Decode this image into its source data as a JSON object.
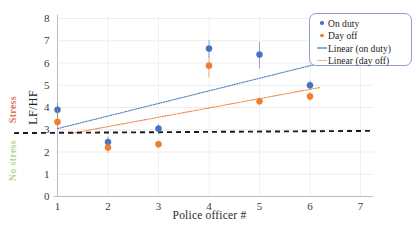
{
  "chart_data": {
    "type": "scatter",
    "title": "",
    "xlabel": "Police officer #",
    "ylabel": "LF/HF",
    "xlim": [
      0.5,
      7.3
    ],
    "ylim": [
      0,
      8
    ],
    "xticks": [
      1,
      2,
      3,
      4,
      5,
      6,
      7
    ],
    "yticks": [
      0,
      1,
      2,
      3,
      4,
      5,
      6,
      7,
      8
    ],
    "grid": true,
    "legend_position": "top-right",
    "x": [
      1,
      2,
      3,
      4,
      5,
      6
    ],
    "series": [
      {
        "name": "On duty",
        "color": "#4472c4",
        "marker": "circle",
        "values": [
          3.9,
          2.45,
          3.05,
          6.65,
          6.38,
          5.0
        ],
        "error_low": [
          3.55,
          2.2,
          2.8,
          6.25,
          5.75,
          4.8
        ],
        "error_high": [
          4.2,
          2.7,
          3.25,
          7.05,
          6.95,
          5.2
        ]
      },
      {
        "name": "Day off",
        "color": "#ed7d31",
        "marker": "circle",
        "values": [
          3.35,
          2.2,
          2.35,
          5.88,
          4.28,
          4.5
        ],
        "error_low": [
          3.1,
          1.95,
          2.2,
          5.35,
          4.1,
          4.3
        ],
        "error_high": [
          3.95,
          2.5,
          2.5,
          6.35,
          4.45,
          4.7
        ]
      }
    ],
    "trendlines": [
      {
        "name": "Linear (on duty)",
        "color": "#4472c4",
        "style": "dotted",
        "x0": 1.0,
        "y0": 3.05,
        "x1": 6.3,
        "y1": 6.05
      },
      {
        "name": "Linear (day off)",
        "color": "#ed7d31",
        "style": "dotted",
        "x0": 1.3,
        "y0": 2.85,
        "x1": 6.2,
        "y1": 4.9
      }
    ],
    "threshold_line": {
      "name": "stress-threshold",
      "color": "#1a1a1a",
      "style": "dashed",
      "y_left": 2.85,
      "y_right": 2.95
    },
    "annotations": {
      "stress": "Stress",
      "no_stress": "No stress",
      "stress_color": "#d9795a",
      "no_stress_color": "#b7d69a"
    },
    "legend": [
      {
        "label": "On duty",
        "type": "dot",
        "color": "#4472c4"
      },
      {
        "label": "Day off",
        "type": "dot",
        "color": "#ed7d31"
      },
      {
        "label": "Linear (on duty)",
        "type": "line",
        "color": "#8faadc"
      },
      {
        "label": "Linear (day off)",
        "type": "line",
        "color": "#f4b183"
      }
    ]
  }
}
